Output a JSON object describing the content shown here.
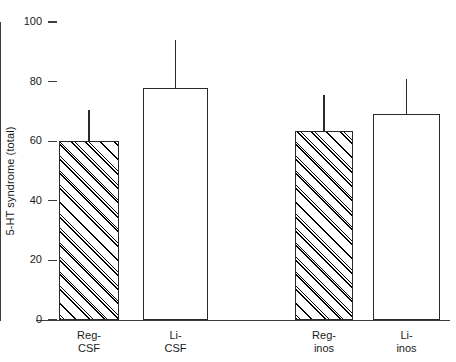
{
  "chart_data": {
    "type": "bar",
    "title": "",
    "subtitle": "",
    "xlabel": "",
    "ylabel": "5-HT syndrome (total)",
    "ylim": [
      0,
      100
    ],
    "yticks": [
      0,
      20,
      40,
      60,
      80,
      100
    ],
    "ytick_labels": [
      "0",
      "20",
      "40",
      "60",
      "80",
      "100"
    ],
    "grid": false,
    "legend": null,
    "categories": [
      "Reg-\nCSF",
      "Li-\nCSF",
      "Reg-\ninos",
      "Li-\ninos"
    ],
    "category_labels_flat": [
      "Reg-CSF",
      "Li-CSF",
      "Reg-inos",
      "Li-inos"
    ],
    "values": [
      60,
      78,
      63.5,
      69
    ],
    "errors_upper": [
      70.5,
      94,
      75.5,
      81
    ],
    "bar_styles": [
      "hatched",
      "open",
      "hatched",
      "open"
    ],
    "colors": {
      "bar_edge": "#2a2a2a",
      "bar_fill_open": "#ffffff",
      "hatch": "#000000",
      "axis": "#3d3d3d",
      "text": "#1a1a1a",
      "background": "#ffffff"
    }
  }
}
